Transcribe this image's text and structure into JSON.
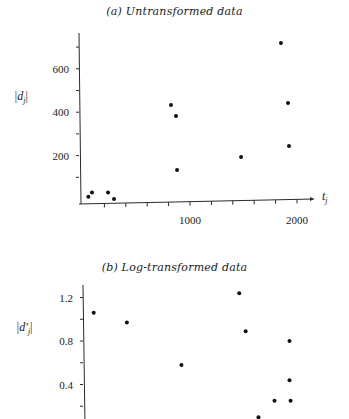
{
  "chart_data": [
    {
      "type": "scatter",
      "title": "(a) Untransformed data",
      "xlabel": "t_j",
      "ylabel": "|d_j|",
      "xticks_labeled": [
        1000,
        2000
      ],
      "xtick_step": 200,
      "yticks_labeled": [
        200,
        400,
        600
      ],
      "ytick_step": 100,
      "xlim": [
        0,
        2200
      ],
      "ylim": [
        0,
        760
      ],
      "grid": false,
      "legend": null,
      "points": [
        {
          "x": 50,
          "y": 10
        },
        {
          "x": 84,
          "y": 30
        },
        {
          "x": 234,
          "y": 30
        },
        {
          "x": 290,
          "y": 0
        },
        {
          "x": 822,
          "y": 433
        },
        {
          "x": 869,
          "y": 382
        },
        {
          "x": 879,
          "y": 134
        },
        {
          "x": 1477,
          "y": 194
        },
        {
          "x": 1850,
          "y": 719
        },
        {
          "x": 1916,
          "y": 442
        },
        {
          "x": 1925,
          "y": 244
        }
      ]
    },
    {
      "type": "scatter",
      "title": "(b) Log-transformed data",
      "xlabel": "",
      "ylabel": "|d'_j|",
      "yticks_labeled": [
        0.4,
        0.8,
        1.2
      ],
      "ytick_step": 0.2,
      "xlim": [
        0,
        2200
      ],
      "ylim": [
        0,
        1.35
      ],
      "grid": false,
      "legend": null,
      "note": "x-axis cropped at image bottom; x positions estimated on same scale as (a)",
      "points": [
        {
          "x": 100,
          "y": 1.06
        },
        {
          "x": 410,
          "y": 0.97
        },
        {
          "x": 920,
          "y": 0.58
        },
        {
          "x": 1460,
          "y": 1.24
        },
        {
          "x": 1520,
          "y": 0.89
        },
        {
          "x": 1930,
          "y": 0.8
        },
        {
          "x": 1930,
          "y": 0.44
        },
        {
          "x": 1790,
          "y": 0.25
        },
        {
          "x": 1940,
          "y": 0.25
        },
        {
          "x": 1640,
          "y": 0.1
        }
      ]
    }
  ],
  "figure_a": {
    "title": "(a) Untransformed data",
    "ylabel_main": "|d",
    "ylabel_sub": "j",
    "xlabel_main": "t",
    "xlabel_sub": "j",
    "ytick_labels": [
      "200",
      "400",
      "600"
    ],
    "xtick_labels": [
      "1000",
      "2000"
    ]
  },
  "figure_b": {
    "title": "(b) Log-transformed data",
    "ylabel_main": "|d'",
    "ylabel_sub": "j",
    "ytick_labels": [
      "0.4",
      "0.8",
      "1.2"
    ]
  }
}
